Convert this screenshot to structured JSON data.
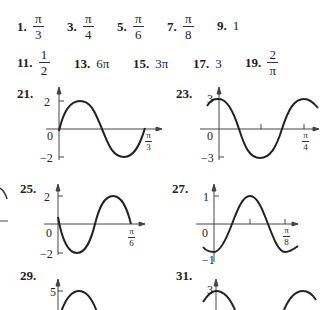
{
  "answers_row1": [
    {
      "label": "1.",
      "num": "π",
      "den": "3"
    },
    {
      "label": "3.",
      "num": "π",
      "den": "4"
    },
    {
      "label": "5.",
      "num": "π",
      "den": "6"
    },
    {
      "label": "7.",
      "num": "π",
      "den": "8"
    },
    {
      "label": "9.",
      "value": "1"
    }
  ],
  "answers_row2": [
    {
      "label": "11.",
      "num": "1",
      "den": "2"
    },
    {
      "label": "13.",
      "value": "6π"
    },
    {
      "label": "15.",
      "value": "3π"
    },
    {
      "label": "17.",
      "value": "3"
    },
    {
      "label": "19.",
      "num": "2",
      "den": "π"
    }
  ],
  "graphs": [
    {
      "label": "21.",
      "ymax": "2",
      "ymin": "−2",
      "origin": "0",
      "xend_num": "π",
      "xend_den": "3"
    },
    {
      "label": "23.",
      "ymax": "3",
      "ymin": "−3",
      "origin": "0",
      "xend_num": "π",
      "xend_den": "4"
    },
    {
      "label": "25.",
      "ymax": "2",
      "ymin": "−2",
      "origin": "0",
      "xend_num": "π",
      "xend_den": "6"
    },
    {
      "label": "27.",
      "ymax": "1",
      "ymin": "−1",
      "origin": "0",
      "xend_num": "π",
      "xend_den": "8"
    },
    {
      "label": "29.",
      "ymax": "5"
    },
    {
      "label": "31.",
      "ymax": "3"
    }
  ]
}
